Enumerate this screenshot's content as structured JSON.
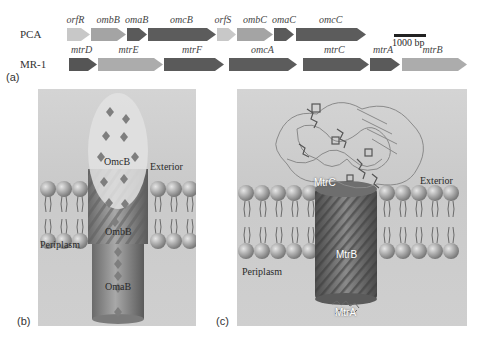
{
  "figure": {
    "panel_labels": {
      "a": "(a)",
      "b": "(b)",
      "c": "(c)"
    },
    "gene_clusters": {
      "rows": [
        {
          "strain": "PCA",
          "genes": [
            {
              "name": "orfR",
              "x": 67,
              "w": 23,
              "shade": "#c8c8c8"
            },
            {
              "name": "ombB",
              "x": 91,
              "w": 35,
              "shade": "#a4a4a4"
            },
            {
              "name": "omaB",
              "x": 127,
              "w": 20,
              "shade": "#5a5a5a"
            },
            {
              "name": "omcB",
              "x": 148,
              "w": 68,
              "shade": "#5c5c5c"
            },
            {
              "name": "orfS",
              "x": 217,
              "w": 19,
              "shade": "#c8c8c8"
            },
            {
              "name": "ombC",
              "x": 237,
              "w": 36,
              "shade": "#a4a4a4"
            },
            {
              "name": "omaC",
              "x": 274,
              "w": 20,
              "shade": "#5a5a5a"
            },
            {
              "name": "omcC",
              "x": 296,
              "w": 70,
              "shade": "#5c5c5c"
            }
          ]
        },
        {
          "strain": "MR-1",
          "genes": [
            {
              "name": "mtrD",
              "x": 69,
              "w": 28,
              "shade": "#555555"
            },
            {
              "name": "mtrE",
              "x": 98,
              "w": 65,
              "shade": "#acacac"
            },
            {
              "name": "mtrF",
              "x": 164,
              "w": 60,
              "shade": "#5a5a5a"
            },
            {
              "name": "omcA",
              "x": 229,
              "w": 68,
              "shade": "#5c5c5c"
            },
            {
              "name": "mtrC",
              "x": 303,
              "w": 66,
              "shade": "#5c5c5c"
            },
            {
              "name": "mtrA",
              "x": 370,
              "w": 30,
              "shade": "#5a5a5a"
            },
            {
              "name": "mtrB",
              "x": 402,
              "w": 65,
              "shade": "#acacac"
            }
          ]
        }
      ],
      "scale_bar": {
        "label": "1000 bp"
      }
    },
    "panel_b": {
      "proteins": [
        "OmcB",
        "OmbB",
        "OmaB"
      ],
      "regions": {
        "exterior": "Exterior",
        "periplasm": "Periplasm"
      }
    },
    "panel_c": {
      "proteins": [
        "MtrC",
        "MtrB",
        "MtrA"
      ],
      "regions": {
        "exterior": "Exterior",
        "periplasm": "Periplasm"
      }
    }
  }
}
